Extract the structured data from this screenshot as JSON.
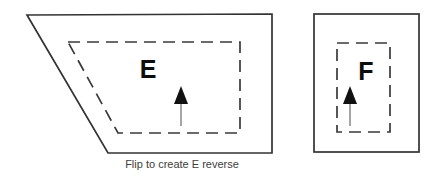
{
  "diagram": {
    "title": "Flip to create E reverse",
    "background_color": "#ffffff",
    "outline_color": "#333333",
    "dashed_color": "#3a3a3a",
    "glyph_color": "#0d0d0d",
    "arrow_color": "#111111",
    "caption_color": "#3d3d3d",
    "panels": [
      {
        "id": "left-panel",
        "shape": "trapezoid",
        "label": "E",
        "caption": "Flip to create E reverse",
        "arrow_direction": "up",
        "outline_points": "27,15 272,14 272,153 108,153",
        "dashed_points": "68,42 240,42 240,133 118,133",
        "label_x": 148,
        "label_y": 78,
        "arrow_x": 181,
        "arrow_top": 86,
        "arrow_bottom": 126
      },
      {
        "id": "right-panel",
        "shape": "rectangle",
        "label": "F",
        "arrow_direction": "up",
        "outline_x": 314,
        "outline_y": 14,
        "outline_w": 105,
        "outline_h": 138,
        "dashed_x": 337,
        "dashed_y": 43,
        "dashed_w": 53,
        "dashed_h": 89,
        "label_x": 360,
        "label_y": 80,
        "arrow_x": 350,
        "arrow_top": 86,
        "arrow_bottom": 126
      }
    ],
    "caption": {
      "text": "Flip to create E reverse",
      "x": 182,
      "y": 168
    }
  }
}
